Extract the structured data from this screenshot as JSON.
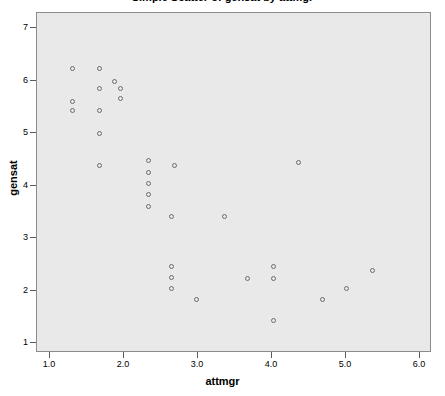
{
  "chart_data": {
    "type": "scatter",
    "title": "Simple Scatter of gensat by attmgr",
    "xlabel": "attmgr",
    "ylabel": "gensat",
    "xlim": [
      0.82,
      6.18
    ],
    "ylim": [
      0.78,
      7.1
    ],
    "xticks": [
      1.0,
      2.0,
      3.0,
      4.0,
      5.0,
      6.0
    ],
    "xticklabels": [
      "1.0",
      "2.0",
      "3.0",
      "4.0",
      "5.0",
      "6.0"
    ],
    "yticks": [
      1,
      2,
      3,
      4,
      5,
      6,
      7
    ],
    "yticklabels": [
      "1",
      "2",
      "3",
      "4",
      "5",
      "6",
      "7"
    ],
    "grid": false,
    "legend": false,
    "marker": "open-circle",
    "marker_color": "#6b6b6b",
    "plot_background": "#e9e9e9",
    "page_background": "#ffffff",
    "points": [
      {
        "x": 1.31,
        "y": 6.22
      },
      {
        "x": 1.31,
        "y": 5.6
      },
      {
        "x": 1.31,
        "y": 5.41
      },
      {
        "x": 1.68,
        "y": 6.22
      },
      {
        "x": 1.68,
        "y": 5.84
      },
      {
        "x": 1.68,
        "y": 5.41
      },
      {
        "x": 1.68,
        "y": 4.98
      },
      {
        "x": 1.68,
        "y": 4.37
      },
      {
        "x": 1.88,
        "y": 5.98
      },
      {
        "x": 1.96,
        "y": 5.84
      },
      {
        "x": 1.96,
        "y": 5.65
      },
      {
        "x": 2.34,
        "y": 4.46
      },
      {
        "x": 2.34,
        "y": 4.23
      },
      {
        "x": 2.34,
        "y": 4.02
      },
      {
        "x": 2.34,
        "y": 3.81
      },
      {
        "x": 2.34,
        "y": 3.6
      },
      {
        "x": 2.69,
        "y": 4.37
      },
      {
        "x": 2.65,
        "y": 3.4
      },
      {
        "x": 2.65,
        "y": 2.45
      },
      {
        "x": 2.65,
        "y": 2.24
      },
      {
        "x": 2.65,
        "y": 2.03
      },
      {
        "x": 2.99,
        "y": 1.82
      },
      {
        "x": 3.36,
        "y": 3.4
      },
      {
        "x": 4.36,
        "y": 4.43
      },
      {
        "x": 3.68,
        "y": 2.22
      },
      {
        "x": 4.03,
        "y": 2.45
      },
      {
        "x": 4.03,
        "y": 2.22
      },
      {
        "x": 4.03,
        "y": 1.41
      },
      {
        "x": 4.69,
        "y": 1.82
      },
      {
        "x": 5.02,
        "y": 2.03
      },
      {
        "x": 5.37,
        "y": 2.37
      }
    ]
  }
}
